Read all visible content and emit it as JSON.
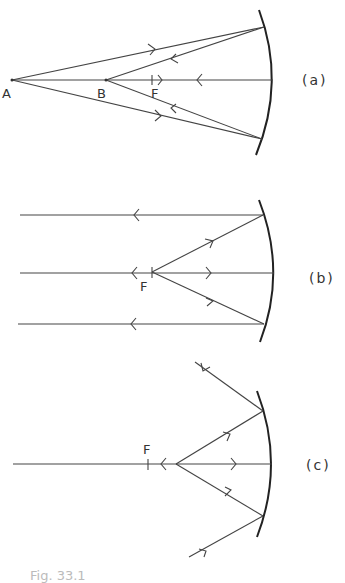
{
  "panels": [
    {
      "id": "a",
      "label": "(a)",
      "points": [
        {
          "name": "A",
          "label": "A"
        },
        {
          "name": "B",
          "label": "B"
        },
        {
          "name": "F",
          "label": "F"
        }
      ],
      "description": "Concave mirror: rays from A reflect and converge at B, between A and F"
    },
    {
      "id": "b",
      "label": "(b)",
      "points": [
        {
          "name": "F",
          "label": "F"
        }
      ],
      "description": "Concave mirror: rays from focal point F reflect as parallel rays"
    },
    {
      "id": "c",
      "label": "(c)",
      "points": [
        {
          "name": "F",
          "label": "F"
        }
      ],
      "description": "Concave mirror: rays from a point inside F reflect and diverge"
    }
  ],
  "caption": "Fig. 33.1"
}
